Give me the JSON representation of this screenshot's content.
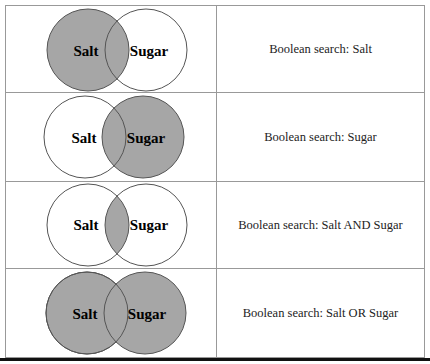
{
  "colors": {
    "shade": "#a6a6a6",
    "outline": "#555555"
  },
  "rows": [
    {
      "left": "Salt",
      "right": "Sugar",
      "shade": "left",
      "caption": "Boolean search: Salt"
    },
    {
      "left": "Salt",
      "right": "Sugar",
      "shade": "right",
      "caption": "Boolean search: Sugar"
    },
    {
      "left": "Salt",
      "right": "Sugar",
      "shade": "intersection",
      "caption": "Boolean search: Salt AND Sugar"
    },
    {
      "left": "Salt",
      "right": "Sugar",
      "shade": "union",
      "caption": "Boolean search: Salt OR Sugar"
    }
  ]
}
